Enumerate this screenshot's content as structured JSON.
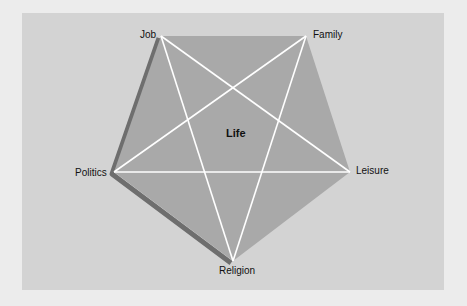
{
  "diagram": {
    "center_label": "Life",
    "vertices": [
      {
        "id": "job",
        "label": "Job",
        "x": 161,
        "y": 36
      },
      {
        "id": "family",
        "label": "Family",
        "x": 306,
        "y": 36
      },
      {
        "id": "leisure",
        "label": "Leisure",
        "x": 350,
        "y": 172
      },
      {
        "id": "religion",
        "label": "Religion",
        "x": 233,
        "y": 261
      },
      {
        "id": "politics",
        "label": "Politics",
        "x": 114,
        "y": 172
      }
    ],
    "colors": {
      "background": "#ececec",
      "panel": "#d3d3d3",
      "pentagon": "#a9a9a9",
      "shadow": "#6e6e6e",
      "star_lines": "#ffffff"
    }
  }
}
